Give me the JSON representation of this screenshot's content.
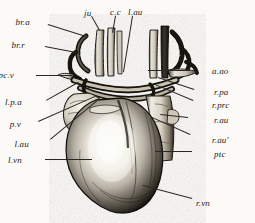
{
  "figure": {
    "background_color": "#fbfaf7",
    "ink_color": "#23211e",
    "caption": ""
  },
  "labels": [
    {
      "id": "br-a",
      "text": "br.a",
      "x": 30,
      "y": 18,
      "align": "right",
      "leader": {
        "x1": 48,
        "y1": 24,
        "x2": 86,
        "y2": 36
      }
    },
    {
      "id": "ju",
      "text": "ju",
      "x": 84,
      "y": 9,
      "align": "left",
      "leader": {
        "x1": 92,
        "y1": 16,
        "x2": 100,
        "y2": 30
      }
    },
    {
      "id": "c-c",
      "text": "c.c",
      "x": 110,
      "y": 8,
      "align": "left",
      "leader": {
        "x1": 116,
        "y1": 16,
        "x2": 113,
        "y2": 33
      }
    },
    {
      "id": "l-au-top",
      "text": "l.au",
      "x": 128,
      "y": 8,
      "align": "left",
      "leader": {
        "x1": 133,
        "y1": 16,
        "x2": 124,
        "y2": 72
      }
    },
    {
      "id": "br-r",
      "text": "br.r",
      "x": 25,
      "y": 41,
      "align": "right",
      "leader": {
        "x1": 45,
        "y1": 46,
        "x2": 76,
        "y2": 52
      }
    },
    {
      "id": "pc-v",
      "text": "pc.v",
      "x": 14,
      "y": 71,
      "align": "right",
      "leader": {
        "x1": 36,
        "y1": 75,
        "x2": 72,
        "y2": 75
      }
    },
    {
      "id": "l-p-a",
      "text": "l.p.a",
      "x": 22,
      "y": 98,
      "align": "right",
      "leader": {
        "x1": 46,
        "y1": 100,
        "x2": 78,
        "y2": 82
      }
    },
    {
      "id": "p-v",
      "text": "p.v",
      "x": 21,
      "y": 120,
      "align": "right",
      "leader": {
        "x1": 38,
        "y1": 121,
        "x2": 97,
        "y2": 95
      }
    },
    {
      "id": "l-au",
      "text": "l.au",
      "x": 29,
      "y": 140,
      "align": "right",
      "leader": {
        "x1": 50,
        "y1": 139,
        "x2": 96,
        "y2": 101
      }
    },
    {
      "id": "l-vn",
      "text": "l.vn",
      "x": 22,
      "y": 156,
      "align": "right",
      "leader": {
        "x1": 45,
        "y1": 159,
        "x2": 92,
        "y2": 159
      }
    },
    {
      "id": "a-ao",
      "text": "a.ao",
      "x": 212,
      "y": 67,
      "align": "left",
      "leader": {
        "x1": 190,
        "y1": 71,
        "x2": 148,
        "y2": 71
      }
    },
    {
      "id": "r-pa",
      "text": "r.pa",
      "x": 214,
      "y": 88,
      "align": "left",
      "leader": {
        "x1": 194,
        "y1": 90,
        "x2": 158,
        "y2": 78
      }
    },
    {
      "id": "r-prc",
      "text": "r.prc",
      "x": 212,
      "y": 101,
      "align": "left",
      "leader": {
        "x1": 193,
        "y1": 101,
        "x2": 155,
        "y2": 85
      }
    },
    {
      "id": "r-au",
      "text": "r.au",
      "x": 214,
      "y": 116,
      "align": "left",
      "leader": {
        "x1": 188,
        "y1": 118,
        "x2": 160,
        "y2": 115
      }
    },
    {
      "id": "r-au-prime",
      "text": "r.au'",
      "x": 212,
      "y": 136,
      "align": "left",
      "leader": {
        "x1": 190,
        "y1": 135,
        "x2": 152,
        "y2": 118
      }
    },
    {
      "id": "ptc",
      "text": "ptc",
      "x": 214,
      "y": 150,
      "align": "left",
      "leader": {
        "x1": 192,
        "y1": 152,
        "x2": 155,
        "y2": 152
      }
    },
    {
      "id": "r-vn",
      "text": "r.vn",
      "x": 196,
      "y": 199,
      "align": "left",
      "leader": {
        "x1": 192,
        "y1": 199,
        "x2": 143,
        "y2": 186
      }
    }
  ]
}
